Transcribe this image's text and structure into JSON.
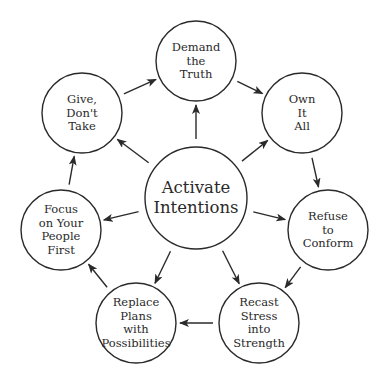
{
  "diagram": {
    "type": "cycle-with-hub",
    "stroke_color": "#2a2a2a",
    "background": "#ffffff",
    "center": {
      "id": "activate",
      "lines": [
        "Activate",
        "Intentions"
      ],
      "cx": 196,
      "cy": 198,
      "r": 51
    },
    "nodes": [
      {
        "id": "demand",
        "lines": [
          "Demand",
          "the",
          "Truth"
        ],
        "cx": 196,
        "cy": 61,
        "r": 40
      },
      {
        "id": "own",
        "lines": [
          "Own",
          "It",
          "All"
        ],
        "cx": 302,
        "cy": 113,
        "r": 40
      },
      {
        "id": "refuse",
        "lines": [
          "Refuse",
          "to",
          "Conform"
        ],
        "cx": 328,
        "cy": 230,
        "r": 40
      },
      {
        "id": "recast",
        "lines": [
          "Recast",
          "Stress",
          "into",
          "Strength"
        ],
        "cx": 259,
        "cy": 323,
        "r": 40
      },
      {
        "id": "replace",
        "lines": [
          "Replace",
          "Plans",
          "with",
          "Possibilities"
        ],
        "cx": 136,
        "cy": 323,
        "r": 40
      },
      {
        "id": "focus",
        "lines": [
          "Focus",
          "on Your",
          "People",
          "First"
        ],
        "cx": 61,
        "cy": 230,
        "r": 40
      },
      {
        "id": "give",
        "lines": [
          "Give,",
          "Don't",
          "Take"
        ],
        "cx": 82,
        "cy": 113,
        "r": 40
      }
    ],
    "cycle_edges": [
      [
        "demand",
        "own"
      ],
      [
        "own",
        "refuse"
      ],
      [
        "refuse",
        "recast"
      ],
      [
        "recast",
        "replace"
      ],
      [
        "replace",
        "focus"
      ],
      [
        "focus",
        "give"
      ],
      [
        "give",
        "demand"
      ]
    ],
    "hub_edges": [
      [
        "activate",
        "demand"
      ],
      [
        "activate",
        "own"
      ],
      [
        "activate",
        "refuse"
      ],
      [
        "activate",
        "recast"
      ],
      [
        "activate",
        "replace"
      ],
      [
        "activate",
        "focus"
      ],
      [
        "activate",
        "give"
      ]
    ]
  }
}
